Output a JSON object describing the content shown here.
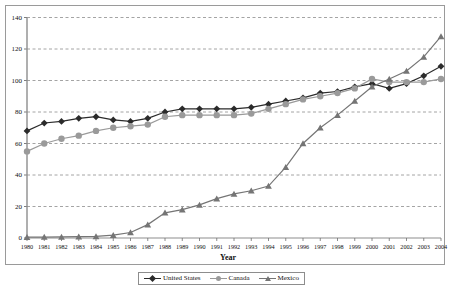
{
  "chart_data": {
    "type": "line",
    "title": "",
    "xlabel": "Year",
    "ylabel": "",
    "ylim": [
      0,
      140
    ],
    "ytick_step": 20,
    "grid": true,
    "legend_position": "bottom",
    "categories": [
      "1980",
      "1981",
      "1982",
      "1983",
      "1984",
      "1985",
      "1986",
      "1987",
      "1988",
      "1989",
      "1990",
      "1991",
      "1992",
      "1993",
      "1994",
      "1995",
      "1996",
      "1997",
      "1998",
      "1999",
      "2000",
      "2001",
      "2002",
      "2003",
      "2004"
    ],
    "yticks": [
      "0",
      "20",
      "40",
      "60",
      "80",
      "100",
      "120",
      "140"
    ],
    "series": [
      {
        "name": "United States",
        "color": "#2b2b2b",
        "marker": "diamond",
        "values": [
          68,
          73,
          74,
          76,
          77,
          75,
          74,
          76,
          80,
          82,
          82,
          82,
          82,
          83,
          85,
          87,
          89,
          92,
          93,
          96,
          98,
          95,
          98,
          103,
          109
        ]
      },
      {
        "name": "Canada",
        "color": "#9a9a9a",
        "marker": "circle",
        "values": [
          55,
          60,
          63,
          65,
          68,
          70,
          71,
          72,
          77,
          78,
          78,
          78,
          78,
          79,
          82,
          85,
          88,
          90,
          92,
          95,
          101,
          99,
          99,
          99,
          101
        ]
      },
      {
        "name": "Mexico",
        "color": "#757575",
        "marker": "triangle",
        "values": [
          0.5,
          0.6,
          0.7,
          0.9,
          1.0,
          1.8,
          3.5,
          8.5,
          16,
          18,
          21,
          25,
          28,
          30,
          33,
          45,
          60,
          70,
          78,
          87,
          96,
          101,
          106,
          115,
          128
        ]
      }
    ]
  },
  "legend": {
    "items": [
      {
        "label": "United States"
      },
      {
        "label": "Canada"
      },
      {
        "label": "Mexico"
      }
    ]
  },
  "axes": {
    "x_title": "Year"
  }
}
